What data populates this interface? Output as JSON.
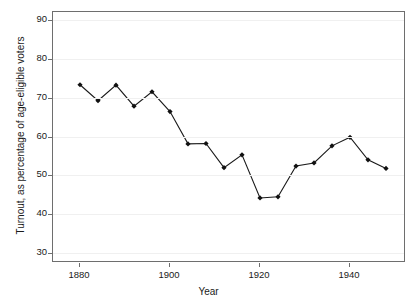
{
  "chart_data": {
    "type": "line",
    "title": "",
    "xlabel": "Year",
    "ylabel": "Turnout, as percentage of age-eligible voters",
    "xlim": [
      1874,
      1952
    ],
    "ylim": [
      28,
      92
    ],
    "xticks": [
      1880,
      1900,
      1920,
      1940
    ],
    "yticks": [
      30,
      40,
      50,
      60,
      70,
      80,
      90
    ],
    "grid": "horizontal-faint",
    "legend": "none",
    "marker": "filled-diamond",
    "line_color": "#1a1a1a",
    "marker_color": "#111111",
    "grid_color": "#f0f0f0",
    "frame_color": "#6e6e6e",
    "x": [
      1880,
      1884,
      1888,
      1892,
      1896,
      1900,
      1904,
      1908,
      1912,
      1916,
      1920,
      1924,
      1928,
      1932,
      1936,
      1940,
      1944,
      1948
    ],
    "values": [
      73.3,
      69.2,
      73.2,
      67.8,
      71.5,
      66.4,
      58.1,
      58.2,
      52.0,
      55.3,
      44.2,
      44.5,
      52.4,
      53.2,
      57.6,
      59.8,
      54.0,
      51.8
    ],
    "series": [
      {
        "name": "Turnout",
        "values": [
          73.3,
          69.2,
          73.2,
          67.8,
          71.5,
          66.4,
          58.1,
          58.2,
          52.0,
          55.3,
          44.2,
          44.5,
          52.4,
          53.2,
          57.6,
          59.8,
          54.0,
          51.8
        ]
      }
    ]
  },
  "axes": {
    "y_tick_labels": [
      "90",
      "80",
      "70",
      "60",
      "50",
      "40",
      "30"
    ],
    "x_tick_labels": [
      "1880",
      "1900",
      "1920",
      "1940"
    ],
    "x_title": "Year",
    "y_title": "Turnout, as percentage of age-eligible voters"
  }
}
